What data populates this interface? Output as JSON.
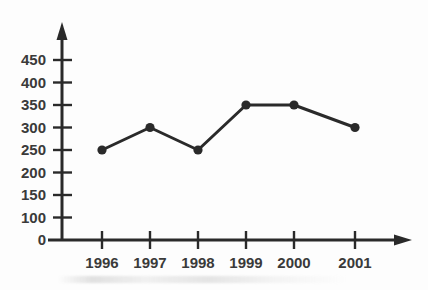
{
  "chart_data": {
    "type": "line",
    "title": "",
    "xlabel": "",
    "ylabel": "",
    "categories": [
      "1996",
      "1997",
      "1998",
      "1999",
      "2000",
      "2001"
    ],
    "values": [
      250,
      300,
      250,
      350,
      350,
      300
    ],
    "series": [
      {
        "name": "series-1",
        "values": [
          250,
          300,
          250,
          350,
          350,
          300
        ]
      }
    ],
    "y_tick_labels": [
      "0",
      "100",
      "150",
      "200",
      "250",
      "300",
      "350",
      "400",
      "450"
    ],
    "y_tick_values": [
      0,
      100,
      150,
      200,
      250,
      300,
      350,
      400,
      450
    ],
    "x_tick_labels": [
      "1996",
      "1997",
      "1998",
      "1999",
      "2000",
      "2001"
    ],
    "ylim": [
      0,
      450
    ],
    "grid": false,
    "legend": false,
    "legend_position": "none",
    "annotations": [],
    "marker_style": "filled-circle",
    "axis_arrows": true,
    "colors": {
      "line": "#2a2a2a",
      "marker": "#2a2a2a",
      "axis": "#2a2a2a",
      "label": "#3a3a3a",
      "background": "#fdfdfd"
    }
  }
}
